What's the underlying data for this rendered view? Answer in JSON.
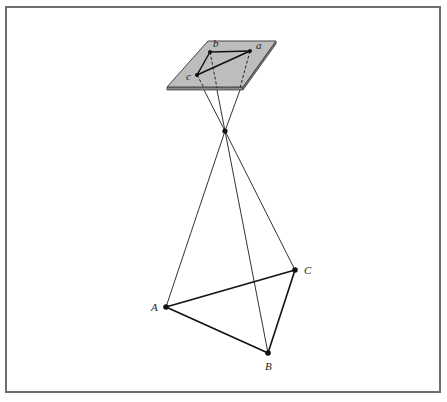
{
  "figure": {
    "frame": {
      "x": 6,
      "y": 7,
      "width": 434,
      "height": 385,
      "color": "#6e6e6e"
    },
    "plate": {
      "fill": "#bdbdbd",
      "edge_color": "#444444",
      "corners": {
        "top_left": [
          208,
          41
        ],
        "top_right": [
          276,
          41
        ],
        "bottom_right": [
          243,
          87
        ],
        "bottom_left": [
          167,
          87
        ]
      },
      "thickness": 3
    },
    "perspective_center": {
      "x": 225,
      "y": 131
    },
    "image_points": [
      {
        "id": "a",
        "label": "a",
        "x": 250,
        "y": 51,
        "label_x": 256,
        "label_y": 49
      },
      {
        "id": "b",
        "label": "b",
        "x": 210,
        "y": 52,
        "label_x": 213,
        "label_y": 47
      },
      {
        "id": "c",
        "label": "c",
        "x": 197,
        "y": 75,
        "label_x": 186,
        "label_y": 80
      }
    ],
    "ground_points": [
      {
        "id": "A",
        "label": "A",
        "x": 166,
        "y": 307,
        "label_x": 151,
        "label_y": 311
      },
      {
        "id": "B",
        "label": "B",
        "x": 268,
        "y": 353,
        "label_x": 265,
        "label_y": 370
      },
      {
        "id": "C",
        "label": "C",
        "x": 295,
        "y": 270,
        "label_x": 304,
        "label_y": 274
      }
    ],
    "plate_exit_points": [
      {
        "for": "c",
        "x": 204,
        "y": 90
      },
      {
        "for": "b",
        "x": 217,
        "y": 90
      },
      {
        "for": "a",
        "x": 240,
        "y": 90
      }
    ],
    "caption_partial": ""
  }
}
